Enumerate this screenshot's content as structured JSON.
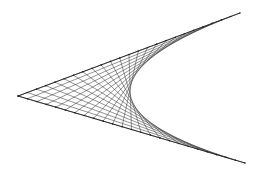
{
  "figure": {
    "type": "string-art-envelope",
    "vertex": [
      18,
      96
    ],
    "arm_a_end": [
      240,
      13
    ],
    "arm_b_end": [
      245,
      163
    ],
    "divisions": 24,
    "colors": {
      "background": "#ffffff",
      "lines": "#3a3a3a",
      "arms": "#222222"
    }
  }
}
